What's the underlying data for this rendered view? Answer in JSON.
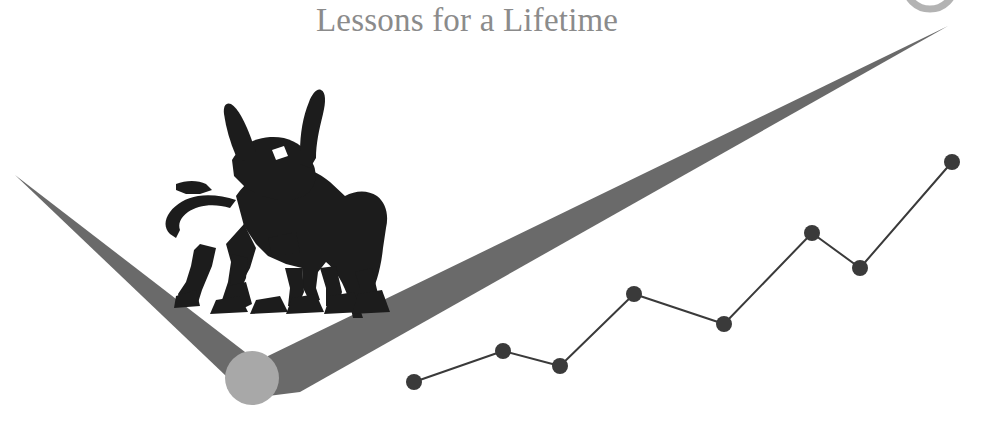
{
  "page": {
    "title": "Lessons for a Lifetime",
    "background_color": "#ffffff",
    "width": 992,
    "height": 422
  },
  "branding": {
    "title_text": "Lessons for a Lifetime",
    "title_color": "#8b8b8b",
    "logo_name": "bull-checkmark-logo",
    "bull_color": "#1c1c1c",
    "checkmark_color": "#6a6a6a",
    "pivot_circle_color": "#a8a8a8",
    "corner_arc_color": "#8f8f8f"
  },
  "chart_data": {
    "type": "line",
    "title": "",
    "xlabel": "",
    "ylabel": "",
    "grid": false,
    "legend": null,
    "line_color": "#3a3a3a",
    "marker_color": "#3a3a3a",
    "marker_radius": 8,
    "line_width": 2,
    "xlim": [
      0,
      9
    ],
    "ylim": [
      0,
      10
    ],
    "x": [
      0,
      1,
      2,
      3,
      4,
      5,
      6,
      7,
      8,
      9
    ],
    "points_px": [
      {
        "x": 414,
        "y": 382
      },
      {
        "x": 503,
        "y": 351
      },
      {
        "x": 560,
        "y": 366
      },
      {
        "x": 634,
        "y": 294
      },
      {
        "x": 724,
        "y": 324
      },
      {
        "x": 812,
        "y": 233
      },
      {
        "x": 860,
        "y": 268
      },
      {
        "x": 952,
        "y": 162
      }
    ],
    "values": [
      1.0,
      2.3,
      1.7,
      4.8,
      3.6,
      7.3,
      5.8,
      10.0
    ],
    "categories": [
      "1",
      "2",
      "3",
      "4",
      "5",
      "6",
      "7",
      "8"
    ]
  },
  "shapes": {
    "checkmark_left_arm": "tapered stroke from upper-left point down to pivot",
    "checkmark_right_arm": "tapered stroke from pivot up to upper-right point",
    "left_tip_px": {
      "x": 15,
      "y": 175
    },
    "right_tip_px": {
      "x": 948,
      "y": 26
    },
    "pivot_px": {
      "x": 252,
      "y": 378
    },
    "pivot_radius_px": 27
  }
}
